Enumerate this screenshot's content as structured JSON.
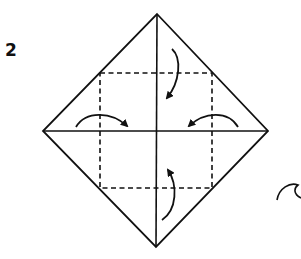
{
  "diagram": {
    "step_number": "2",
    "colors": {
      "line": "#111111",
      "background": "#ffffff"
    },
    "shape": {
      "diamond": {
        "top": [
          157,
          14
        ],
        "right": [
          268,
          131
        ],
        "bottom": [
          156,
          247
        ],
        "left": [
          43,
          131
        ]
      },
      "dashed_square": {
        "x1": 100,
        "y1": 73,
        "x2": 212,
        "y2": 188
      }
    },
    "arrows": [
      {
        "name": "fold-top-to-center",
        "direction": "down"
      },
      {
        "name": "fold-left-to-center",
        "direction": "right"
      },
      {
        "name": "fold-right-to-center",
        "direction": "left"
      },
      {
        "name": "fold-bottom-to-center",
        "direction": "up"
      }
    ],
    "symbols": [
      {
        "name": "turn-over-symbol",
        "position": "bottom-right (partially cropped)"
      }
    ]
  }
}
